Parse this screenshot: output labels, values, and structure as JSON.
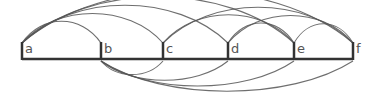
{
  "diagram": {
    "type": "arc-diagram",
    "baseline_y": 59,
    "nodes": [
      {
        "id": "a",
        "label": "a",
        "x": 22
      },
      {
        "id": "b",
        "label": "b",
        "x": 101
      },
      {
        "id": "c",
        "label": "c",
        "x": 163
      },
      {
        "id": "d",
        "label": "d",
        "x": 228
      },
      {
        "id": "e",
        "label": "e",
        "x": 294
      },
      {
        "id": "f",
        "label": "f",
        "x": 353
      }
    ],
    "arcs_above": [
      {
        "from": "a",
        "to": "b"
      },
      {
        "from": "a",
        "to": "c"
      },
      {
        "from": "a",
        "to": "d"
      },
      {
        "from": "a",
        "to": "e"
      },
      {
        "from": "a",
        "to": "f"
      },
      {
        "from": "c",
        "to": "e"
      },
      {
        "from": "c",
        "to": "f"
      },
      {
        "from": "d",
        "to": "e"
      },
      {
        "from": "d",
        "to": "f"
      },
      {
        "from": "e",
        "to": "f"
      }
    ],
    "arcs_below": [
      {
        "from": "b",
        "to": "c"
      },
      {
        "from": "b",
        "to": "d"
      },
      {
        "from": "b",
        "to": "e"
      },
      {
        "from": "b",
        "to": "f"
      }
    ],
    "colors": {
      "baseline": "#333333",
      "arc": "#555555",
      "label": "#555555"
    }
  }
}
